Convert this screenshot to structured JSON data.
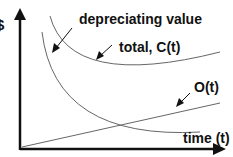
{
  "diagram": {
    "y_axis_label": "$",
    "x_axis_label": "time (t)",
    "labels": {
      "depreciating": "depreciating value",
      "total": "total, C(t)",
      "operating": "O(t)"
    },
    "colors": {
      "axis": "#111111",
      "curve": "#666666",
      "text": "#111111"
    }
  }
}
